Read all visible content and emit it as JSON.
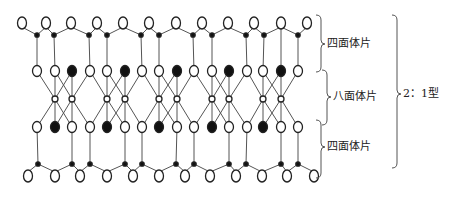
{
  "diagram": {
    "type": "clay-mineral-2-1-layer-structure",
    "colors": {
      "line": "#555555",
      "open_fill": "#ffffff",
      "stroke": "#222222",
      "filled": "#111111"
    },
    "rows": {
      "top_oxygen": {
        "y": 23,
        "x": [
          22,
          46,
          71,
          97,
          123,
          149,
          176,
          202,
          228,
          254,
          281,
          307
        ]
      },
      "top_silicon": {
        "y": 35,
        "x": [
          37,
          54,
          89,
          107,
          141,
          159,
          193,
          212,
          246,
          264,
          298
        ]
      },
      "upper_octa": {
        "y": 71,
        "x": [
          37,
          55,
          72,
          90,
          107,
          125,
          142,
          159,
          177,
          194,
          212,
          229,
          247,
          263,
          281,
          298
        ],
        "filled_x": [
          72,
          125,
          177,
          229,
          281
        ]
      },
      "cation": {
        "y": 99,
        "x": [
          55,
          72,
          107,
          125,
          159,
          177,
          212,
          229,
          263,
          281
        ]
      },
      "lower_octa": {
        "y": 127,
        "x": [
          37,
          55,
          72,
          90,
          107,
          125,
          142,
          159,
          177,
          194,
          212,
          229,
          247,
          263,
          281,
          298
        ],
        "filled_x": [
          55,
          107,
          159,
          212,
          263
        ]
      },
      "bottom_silicon": {
        "y": 164,
        "x": [
          38,
          72,
          90,
          125,
          142,
          176,
          194,
          229,
          246,
          281,
          298
        ]
      },
      "bottom_oxygen": {
        "y": 176,
        "x": [
          28,
          55,
          80,
          107,
          133,
          159,
          185,
          210,
          236,
          262,
          287,
          314
        ]
      }
    }
  },
  "labels": {
    "tetra_top": "四面体片",
    "octa": "八面体片",
    "tetra_bottom": "四面体片",
    "layer_type": "2：1型"
  }
}
